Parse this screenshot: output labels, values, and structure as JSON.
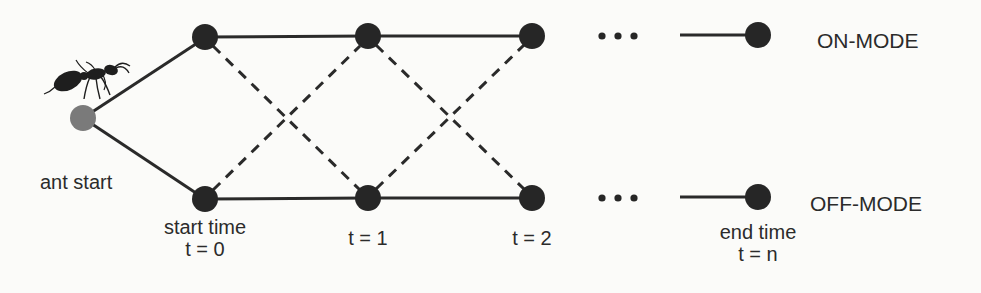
{
  "diagram": {
    "start_label": "ant start",
    "modes": {
      "on": "ON-MODE",
      "off": "OFF-MODE"
    },
    "time_labels": [
      {
        "line1": "start time",
        "line2": "t = 0"
      },
      {
        "line1": "",
        "line2": "t = 1"
      },
      {
        "line1": "",
        "line2": "t = 2"
      },
      {
        "line1": "end time",
        "line2": "t = n"
      }
    ],
    "ellipsis": "•••",
    "colors": {
      "node": "#262626",
      "start_node": "#7a7a7a",
      "edge": "#2a2a2a",
      "text": "#2b2b2b",
      "background": "#fbfbf9"
    },
    "edges": {
      "solid": "same-mode transition",
      "dashed": "mode-switch transition"
    }
  }
}
